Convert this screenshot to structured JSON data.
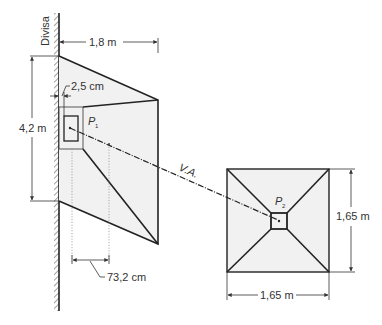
{
  "diagram": {
    "wall_label": "Divisa",
    "footing_p1": {
      "label": "P",
      "subscript": "1",
      "width_label": "1,8 m",
      "height_label": "4,2 m",
      "offset_label": "2,5 cm",
      "eccentricity_label": "73,2 cm"
    },
    "beam": {
      "label": "V.A."
    },
    "footing_p2": {
      "label": "P",
      "subscript": "2",
      "width_label": "1,65 m",
      "height_label": "1,65 m"
    },
    "colors": {
      "line": "#222222",
      "fill": "#f1f1f1",
      "text": "#333333"
    }
  }
}
